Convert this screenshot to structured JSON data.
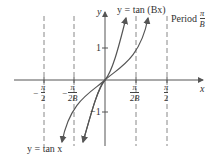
{
  "figure": {
    "curve_label_top": "y = tan (Bx)",
    "curve_label_bottom": "y = tan x",
    "period_label": "Period",
    "period_fraction": {
      "num": "π",
      "den": "B"
    },
    "axis_x_label": "x",
    "axis_y_label": "y",
    "y_ticks": [
      "1",
      "−1"
    ],
    "x_ticks": [
      {
        "sign": "−",
        "num": "π",
        "den": "2"
      },
      {
        "sign": "−",
        "num": "π",
        "den": "2B"
      },
      {
        "sign": "",
        "num": "π",
        "den": "2B"
      },
      {
        "sign": "",
        "num": "π",
        "den": "2"
      }
    ],
    "colors": {
      "axis": "#555555",
      "curve": "#555555",
      "asymptote": "#777777"
    }
  }
}
